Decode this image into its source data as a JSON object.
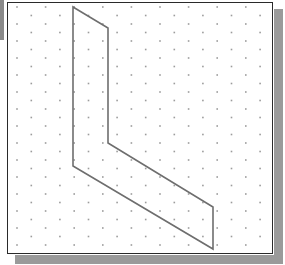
{
  "diagram": {
    "type": "isometric-dot-grid-sketch",
    "colors": {
      "background": "#ffffff",
      "frame_border": "#2a2a2a",
      "shadow": "#9a9a9a",
      "left_strip": "#8a8a8a",
      "shape_stroke": "#6e6e6e",
      "grid_dot": "#9c9c9c"
    },
    "frame": {
      "x": 7,
      "y": 2,
      "width": 265,
      "height": 251
    },
    "grid": {
      "pattern": "offset-columns",
      "origin_x": 17,
      "origin_y": 7,
      "column_spacing": 14.3,
      "row_spacing": 17,
      "odd_column_offset": 8.5
    },
    "shape": {
      "name": "L-shaped parallelogram outline",
      "points": [
        [
          73,
          7
        ],
        [
          108,
          28
        ],
        [
          108,
          143
        ],
        [
          213,
          207
        ],
        [
          213,
          249
        ],
        [
          73,
          166
        ]
      ]
    }
  }
}
